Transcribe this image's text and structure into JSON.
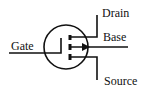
{
  "diagram": {
    "labels": {
      "drain": "Drain",
      "base": "Base",
      "gate": "Gate",
      "source": "Source"
    },
    "stroke_color": "#111111",
    "background": "#ffffff"
  }
}
